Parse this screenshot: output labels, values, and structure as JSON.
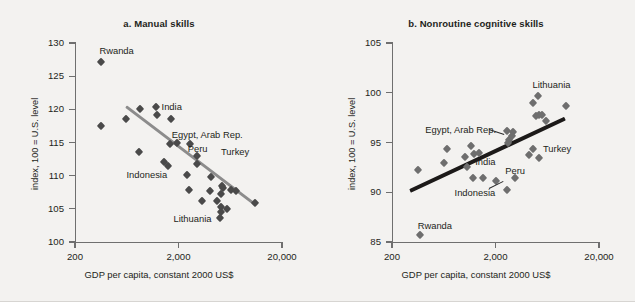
{
  "figure": {
    "background_color": "#f3f2f0",
    "cut_off_header": "",
    "panels": [
      {
        "id": "a",
        "title": "a.  Manual skills",
        "ylabel": "index, 100 = U.S. level",
        "xlabel": "GDP per capita, constant 2000 US$",
        "trend_color": "#8c8c8c",
        "marker_color": "#4a4a4a"
      },
      {
        "id": "b",
        "title": "b.  Nonroutine cognitive skills",
        "ylabel": "index, 100 = U.S. level",
        "xlabel": "GDP per capita, constant 2000 US$",
        "trend_color": "#1c1a19",
        "marker_color": "#6e6e6e"
      }
    ]
  },
  "chart_data": [
    {
      "type": "scatter",
      "panel": "a",
      "title": "a.  Manual skills",
      "xlabel": "GDP per capita, constant 2000 US$",
      "ylabel": "index, 100 = U.S. level",
      "xscale": "log",
      "xlim": [
        200,
        20000
      ],
      "ylim": [
        100,
        130
      ],
      "xticks": [
        200,
        2000,
        20000
      ],
      "xticklabels": [
        "200",
        "2,000",
        "20,000"
      ],
      "yticks": [
        100,
        105,
        110,
        115,
        120,
        125,
        130
      ],
      "yticklabels": [
        "100",
        "105",
        "110",
        "115",
        "120",
        "125",
        "130"
      ],
      "grid": false,
      "legend": "none",
      "trendline": {
        "description": "downward sloping fit line",
        "x_start": 620,
        "y_start": 120.6,
        "x_end": 11000,
        "y_end": 105.8,
        "color": "#8c8c8c"
      },
      "points": [
        {
          "x": 360,
          "y": 127.2,
          "label": "Rwanda"
        },
        {
          "x": 360,
          "y": 117.5,
          "label": ""
        },
        {
          "x": 620,
          "y": 118.6,
          "label": ""
        },
        {
          "x": 1200,
          "y": 120.3,
          "label": "India"
        },
        {
          "x": 1250,
          "y": 119.2,
          "label": ""
        },
        {
          "x": 1700,
          "y": 118.5,
          "label": ""
        },
        {
          "x": 830,
          "y": 113.6,
          "label": ""
        },
        {
          "x": 1650,
          "y": 114.7,
          "label": "Egypt, Arab Rep."
        },
        {
          "x": 1950,
          "y": 114.9,
          "label": ""
        },
        {
          "x": 2600,
          "y": 114.7,
          "label": ""
        },
        {
          "x": 3000,
          "y": 112.9,
          "label": "Peru"
        },
        {
          "x": 3050,
          "y": 111.8,
          "label": ""
        },
        {
          "x": 1450,
          "y": 112.0,
          "label": ""
        },
        {
          "x": 1600,
          "y": 111.5,
          "label": "Indonesia"
        },
        {
          "x": 2400,
          "y": 110.1,
          "label": ""
        },
        {
          "x": 4100,
          "y": 109.8,
          "label": ""
        },
        {
          "x": 2500,
          "y": 107.9,
          "label": ""
        },
        {
          "x": 4000,
          "y": 107.7,
          "label": ""
        },
        {
          "x": 5300,
          "y": 108.4,
          "label": ""
        },
        {
          "x": 5400,
          "y": 108.1,
          "label": ""
        },
        {
          "x": 6400,
          "y": 107.8,
          "label": ""
        },
        {
          "x": 7200,
          "y": 107.7,
          "label": ""
        },
        {
          "x": 5200,
          "y": 107.3,
          "label": ""
        },
        {
          "x": 3400,
          "y": 106.2,
          "label": ""
        },
        {
          "x": 4700,
          "y": 106.2,
          "label": ""
        },
        {
          "x": 11000,
          "y": 105.9,
          "label": ""
        },
        {
          "x": 5200,
          "y": 105.3,
          "label": "Lithuania"
        },
        {
          "x": 5900,
          "y": 104.9,
          "label": ""
        },
        {
          "x": 5100,
          "y": 104.5,
          "label": ""
        },
        {
          "x": 5050,
          "y": 103.6,
          "label": ""
        }
      ],
      "annotations": [
        {
          "text": "Rwanda",
          "near_point": [
            360,
            127.2
          ]
        },
        {
          "text": "India",
          "near_point": [
            1200,
            120.3
          ]
        },
        {
          "text": "Egypt, Arab Rep.",
          "near_point": [
            1650,
            114.7
          ]
        },
        {
          "text": "Peru",
          "near_point": [
            3000,
            112.9
          ]
        },
        {
          "text": "Turkey",
          "near_point": [
            4500,
            113.6
          ]
        },
        {
          "text": "Indonesia",
          "near_point": [
            1600,
            111.5
          ]
        },
        {
          "text": "Lithuania",
          "near_point": [
            5200,
            105.3
          ]
        }
      ]
    },
    {
      "type": "scatter",
      "panel": "b",
      "title": "b.  Nonroutine cognitive skills",
      "xlabel": "GDP per capita, constant 2000 US$",
      "ylabel": "index, 100 = U.S. level",
      "xscale": "log",
      "xlim": [
        200,
        20000
      ],
      "ylim": [
        85,
        105
      ],
      "xticks": [
        200,
        2000,
        20000
      ],
      "xticklabels": [
        "200",
        "2,000",
        "20,000"
      ],
      "yticks": [
        85,
        90,
        95,
        100,
        105
      ],
      "yticklabels": [
        "85",
        "90",
        "95",
        "100",
        "105"
      ],
      "grid": false,
      "legend": "none",
      "trendline": {
        "description": "upward sloping fit line",
        "x_start": 300,
        "y_start": 90.3,
        "x_end": 9500,
        "y_end": 97.6,
        "color": "#1c1a19"
      },
      "points": [
        {
          "x": 370,
          "y": 85.7,
          "label": "Rwanda"
        },
        {
          "x": 360,
          "y": 92.2,
          "label": ""
        },
        {
          "x": 680,
          "y": 94.3,
          "label": ""
        },
        {
          "x": 640,
          "y": 92.9,
          "label": ""
        },
        {
          "x": 1150,
          "y": 94.6,
          "label": ""
        },
        {
          "x": 1020,
          "y": 93.5,
          "label": "India"
        },
        {
          "x": 1050,
          "y": 92.5,
          "label": ""
        },
        {
          "x": 1250,
          "y": 93.8,
          "label": ""
        },
        {
          "x": 1400,
          "y": 93.9,
          "label": ""
        },
        {
          "x": 1500,
          "y": 91.4,
          "label": ""
        },
        {
          "x": 1200,
          "y": 91.4,
          "label": "Indonesia"
        },
        {
          "x": 2000,
          "y": 91.1,
          "label": ""
        },
        {
          "x": 2600,
          "y": 90.2,
          "label": ""
        },
        {
          "x": 2700,
          "y": 95.3,
          "label": ""
        },
        {
          "x": 2650,
          "y": 94.9,
          "label": ""
        },
        {
          "x": 2600,
          "y": 96.2,
          "label": "Egypt, Arab Rep."
        },
        {
          "x": 2950,
          "y": 96.1,
          "label": ""
        },
        {
          "x": 2900,
          "y": 95.7,
          "label": ""
        },
        {
          "x": 3100,
          "y": 91.4,
          "label": "Peru"
        },
        {
          "x": 4200,
          "y": 93.7,
          "label": ""
        },
        {
          "x": 4600,
          "y": 94.3,
          "label": "Turkey"
        },
        {
          "x": 5300,
          "y": 93.4,
          "label": ""
        },
        {
          "x": 4600,
          "y": 99.0,
          "label": ""
        },
        {
          "x": 5200,
          "y": 99.7,
          "label": "Lithuania"
        },
        {
          "x": 4900,
          "y": 97.7,
          "label": ""
        },
        {
          "x": 5300,
          "y": 97.8,
          "label": ""
        },
        {
          "x": 5600,
          "y": 97.8,
          "label": ""
        },
        {
          "x": 6100,
          "y": 97.2,
          "label": ""
        },
        {
          "x": 9500,
          "y": 98.7,
          "label": ""
        }
      ],
      "annotations": [
        {
          "text": "Lithuania",
          "near_point": [
            5200,
            99.7
          ]
        },
        {
          "text": "Egypt, Arab Rep.",
          "near_point": [
            2600,
            96.2
          ]
        },
        {
          "text": "Turkey",
          "near_point": [
            4600,
            94.3
          ]
        },
        {
          "text": "India",
          "near_point": [
            1020,
            93.5
          ]
        },
        {
          "text": "Peru",
          "near_point": [
            3100,
            91.4
          ]
        },
        {
          "text": "Indonesia",
          "near_point": [
            1200,
            91.4
          ]
        },
        {
          "text": "Rwanda",
          "near_point": [
            370,
            85.7
          ]
        }
      ]
    }
  ]
}
